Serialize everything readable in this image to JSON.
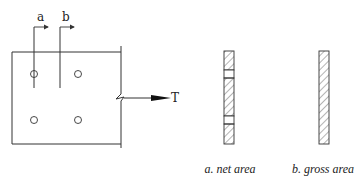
{
  "diagram": {
    "plate": {
      "section_labels": [
        "a",
        "b"
      ],
      "load_label": "T",
      "holes": 4
    },
    "sections": [
      {
        "id": "net",
        "caption": "a. net area"
      },
      {
        "id": "gross",
        "caption": "b. gross area"
      }
    ],
    "colors": {
      "stroke": "#333333",
      "hatch": "#444444",
      "background": "#ffffff"
    }
  }
}
